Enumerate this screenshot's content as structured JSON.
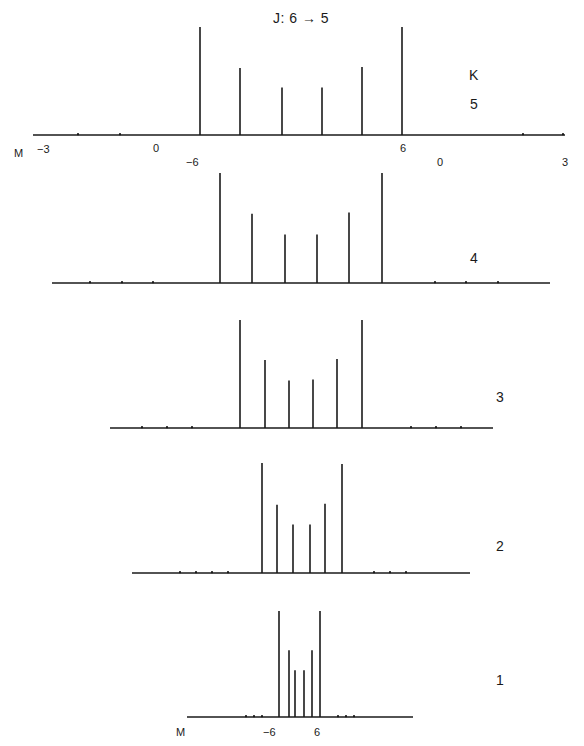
{
  "title": "J: 6 → 5",
  "title_parts": {
    "j": "J:",
    "from": "6",
    "to": "5"
  },
  "k_header": "K",
  "m_label": "M",
  "colors": {
    "line": "#1a1a1a",
    "background": "#ffffff"
  },
  "chart_data": {
    "type": "bar",
    "title": "J: 6 → 5",
    "xlabel": "M",
    "ylabel": "",
    "panels": [
      {
        "K": 5,
        "axis": {
          "x0": 33,
          "x1": 565,
          "y": 135
        },
        "ticks_dots": [
          78,
          120,
          523,
          563
        ],
        "tick_labels": [
          {
            "text": "-3",
            "x": 37,
            "y": 143,
            "sup": true
          },
          {
            "text": "0",
            "x": 153,
            "y": 142
          },
          {
            "text": "-6",
            "x": 186,
            "y": 156
          },
          {
            "text": "6",
            "x": 400,
            "y": 142
          },
          {
            "text": "0",
            "x": 437,
            "y": 156
          },
          {
            "text": "3",
            "x": 562,
            "y": 156
          }
        ],
        "x": [
          200,
          240,
          282,
          322,
          362,
          402
        ],
        "intensities": [
          1.0,
          0.62,
          0.44,
          0.44,
          0.63,
          1.0
        ],
        "max_height": 108,
        "label_pos": {
          "x": 470,
          "y": 96
        }
      },
      {
        "K": 4,
        "axis": {
          "x0": 52,
          "x1": 550,
          "y": 283
        },
        "ticks_dots": [
          90,
          122,
          153,
          435,
          466,
          498
        ],
        "tick_labels": [],
        "x": [
          220,
          252,
          285,
          317,
          349,
          382
        ],
        "intensities": [
          1.0,
          0.63,
          0.44,
          0.44,
          0.64,
          1.0
        ],
        "max_height": 110,
        "label_pos": {
          "x": 470,
          "y": 250
        }
      },
      {
        "K": 3,
        "axis": {
          "x0": 110,
          "x1": 493,
          "y": 428
        },
        "ticks_dots": [
          142,
          167,
          192,
          411,
          436,
          461
        ],
        "tick_labels": [],
        "x": [
          240,
          265,
          289,
          313,
          337,
          362
        ],
        "intensities": [
          1.0,
          0.63,
          0.44,
          0.45,
          0.64,
          1.0
        ],
        "max_height": 108,
        "label_pos": {
          "x": 496,
          "y": 389
        }
      },
      {
        "K": 2,
        "axis": {
          "x0": 132,
          "x1": 470,
          "y": 573
        },
        "ticks_dots": [
          180,
          196,
          212,
          228,
          374,
          390,
          406
        ],
        "tick_labels": [],
        "x": [
          262,
          277,
          293,
          310,
          325,
          342
        ],
        "intensities": [
          1.0,
          0.62,
          0.44,
          0.44,
          0.63,
          0.99
        ],
        "max_height": 110,
        "label_pos": {
          "x": 496,
          "y": 538
        }
      },
      {
        "K": 1,
        "axis": {
          "x0": 187,
          "x1": 413,
          "y": 717
        },
        "ticks_dots": [
          246,
          254,
          262,
          338,
          346,
          354
        ],
        "tick_labels": [
          {
            "text": "-6",
            "x": 263,
            "y": 726
          },
          {
            "text": "6",
            "x": 314,
            "y": 726
          }
        ],
        "x": [
          279,
          289,
          295,
          304,
          312,
          320
        ],
        "intensities": [
          1.0,
          0.63,
          0.44,
          0.44,
          0.63,
          1.0
        ],
        "max_height": 106,
        "label_pos": {
          "x": 496,
          "y": 672
        }
      }
    ]
  }
}
